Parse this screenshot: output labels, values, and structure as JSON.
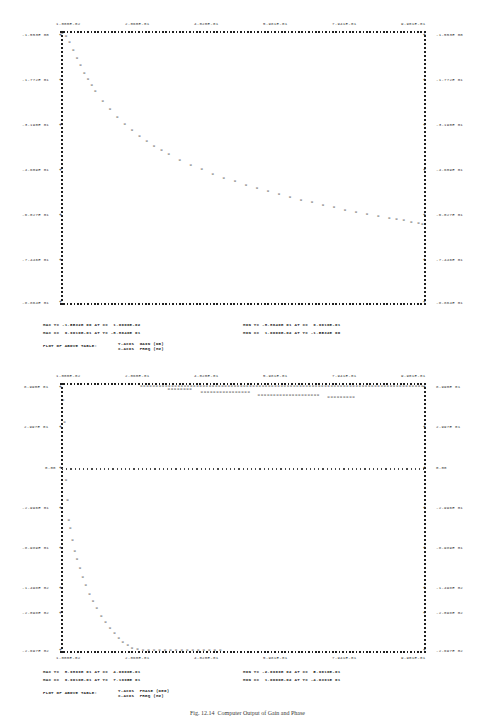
{
  "document": {
    "kind": "line-printer frequency response plot",
    "caption": "Fig. 12.14  Computer Output of Gain and Phase"
  },
  "chart_data": [
    {
      "type": "scatter",
      "title": "PLOT OF ABOVE TABLE:",
      "ylabel": "Y-AXIS  GAIN (DB)",
      "xlabel": "X-AXIS  FREQ (HZ)",
      "marker": "X",
      "xlim": [
        0.01,
        0.9901
      ],
      "ylim": [
        -88.64,
        -1.5532
      ],
      "xticks": [
        "1.000E-02",
        "2.060E-01",
        "4.020E-01",
        "5.981E-01",
        "7.941E-01",
        "9.901E-01"
      ],
      "xtick_values": [
        0.01,
        0.206,
        0.402,
        0.5981,
        0.7941,
        0.9901
      ],
      "yticks": [
        "-1.553E 00",
        "-1.772E 01",
        "-3.190E 01",
        "-4.609E 01",
        "-6.027E 01",
        "-7.446E 01",
        "-8.864E 01"
      ],
      "ytick_values": [
        -1.553,
        -17.72,
        -31.9,
        -46.09,
        -60.27,
        -74.46,
        -88.64
      ],
      "x": [
        0.01,
        0.02,
        0.03,
        0.04,
        0.05,
        0.06,
        0.07,
        0.08,
        0.09,
        0.1,
        0.12,
        0.14,
        0.16,
        0.18,
        0.2,
        0.22,
        0.24,
        0.26,
        0.28,
        0.3,
        0.33,
        0.36,
        0.39,
        0.42,
        0.45,
        0.48,
        0.51,
        0.54,
        0.57,
        0.6,
        0.63,
        0.66,
        0.69,
        0.72,
        0.75,
        0.78,
        0.81,
        0.84,
        0.87,
        0.9,
        0.92,
        0.94,
        0.96,
        0.98,
        0.9901
      ],
      "y": [
        -1.55,
        -2.6,
        -4.6,
        -7.1,
        -9.6,
        -12.0,
        -14.3,
        -16.4,
        -18.4,
        -20.2,
        -23.4,
        -26.2,
        -28.7,
        -30.9,
        -32.9,
        -34.7,
        -36.4,
        -37.9,
        -39.3,
        -40.6,
        -42.4,
        -44.0,
        -45.5,
        -46.9,
        -48.2,
        -49.4,
        -50.5,
        -51.6,
        -52.6,
        -53.6,
        -54.5,
        -55.4,
        -56.2,
        -57.0,
        -57.8,
        -58.5,
        -59.2,
        -59.9,
        -60.6,
        -61.2,
        -61.6,
        -62.0,
        -62.4,
        -62.8,
        -63.1
      ],
      "stats": {
        "max_y": "MAX Y= -1.5532E 00 AT X=  1.0000E-02",
        "max_x": "MAX X=  9.9010E-01 AT Y= -8.8640E 01",
        "min_y": "MIN Y= -8.8640E 01 AT X=  9.9010E-01",
        "min_x": "MIN X=  1.0000E-02 AT Y= -1.5532E 00"
      }
    },
    {
      "type": "scatter",
      "title": "PLOT OF ABOVE TABLE:",
      "ylabel": "Y-AXIS  PHASE (DEG)",
      "xlabel": "X-AXIS  FREQ (HZ)",
      "marker": "X",
      "xlim": [
        0.01,
        0.9901
      ],
      "ylim": [
        -269.7,
        89.9
      ],
      "xticks": [
        "1.000E-02",
        "2.060E-01",
        "4.020E-01",
        "5.981E-01",
        "7.941E-01",
        "9.901E-01"
      ],
      "xtick_values": [
        0.01,
        0.206,
        0.402,
        0.5981,
        0.7941,
        0.9901
      ],
      "yticks": [
        "8.990E 01",
        "2.997E 01",
        "0.00",
        "-2.996E 01",
        "-8.989E 01",
        "-1.498E 02",
        "-2.098E 02",
        "-2.697E 02"
      ],
      "ytick_values": [
        89.9,
        29.97,
        0.0,
        -29.96,
        -89.89,
        -149.8,
        -209.8,
        -269.7
      ],
      "zero_line": 0.0,
      "stats": {
        "max_y": "MAX Y=  8.9899E 01 AT X=  4.0600E-01",
        "max_x": "MAX X=  9.9010E-01 AT Y=  7.1995E 01",
        "min_y": "MIN Y= -2.6969E 02 AT X=  5.9610E-01",
        "min_x": "MIN X=  1.0000E-02 AT Y= -4.0391E 01"
      }
    }
  ],
  "plot_top": {
    "label_plot_of": "PLOT OF ABOVE TABLE:",
    "label_yaxis": "Y-AXIS  GAIN (DB)",
    "label_xaxis": "X-AXIS  FREQ (HZ)"
  },
  "plot_bottom": {
    "label_plot_of": "PLOT OF ABOVE TABLE:",
    "label_yaxis": "Y-AXIS  PHASE (DEG)",
    "label_xaxis": "X-AXIS  FREQ (HZ)"
  }
}
